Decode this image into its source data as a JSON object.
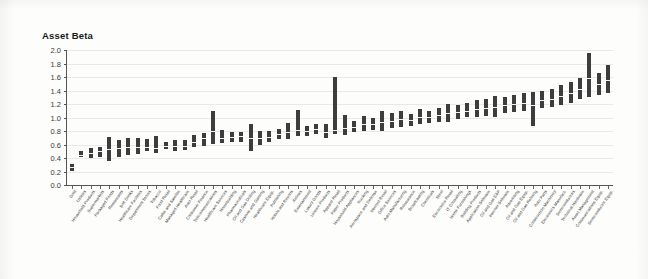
{
  "chart_data": {
    "type": "bar",
    "subtype": "floating-range-bar",
    "title": "Asset Beta",
    "xlabel": "",
    "ylabel": "Asset Beta",
    "ylim": [
      0.0,
      2.0
    ],
    "ytick_labels": [
      "0.0",
      "0.2",
      "0.4",
      "0.6",
      "0.8",
      "1.0",
      "1.2",
      "1.4",
      "1.6",
      "1.8",
      "2.0"
    ],
    "ytick_values": [
      0.0,
      0.2,
      0.4,
      0.6,
      0.8,
      1.0,
      1.2,
      1.4,
      1.6,
      1.8,
      2.0
    ],
    "grid": true,
    "legend": "none",
    "bar_color": "#3d3d3d",
    "categories": [
      "Gold",
      "Utilities",
      "Household Products",
      "Supermarkets",
      "Packaged Foods",
      "Restaurants",
      "Soft Drinks",
      "Healthcare Facilities",
      "Department Stores",
      "Tobacco",
      "Food Retail",
      "Cable and Satellite",
      "Managed Healthcare",
      "Auto Retail",
      "Consumer Finance",
      "Telecommunications",
      "Healthcare Services",
      "Homebuilding",
      "Pharmaceuticals",
      "Oil and Gas Drilling",
      "Casinos and Gaming",
      "Healthcare Equip.",
      "Publishing",
      "Hotels and Resorts",
      "Airlines",
      "Entertainment",
      "Luxury Goods",
      "Leisure Products",
      "Apparel Retail",
      "Paper Products",
      "Household Appliances",
      "Trucking",
      "Aerospace and Defense",
      "Internet Retail",
      "Office Services",
      "Auto Manufacturing",
      "Reinsurance",
      "Broadcasting",
      "Chemicals",
      "Steel",
      "Electronics Retail",
      "IT Consulting",
      "Home Furnishings",
      "Building Products",
      "Application Software",
      "Oil and Gas E&P",
      "Internet Software",
      "Advertising",
      "Oil and Gas Equip.",
      "Oil and Gas Refining",
      "Auto Parts",
      "Construction Machinery",
      "Electronics Manufact.",
      "Semiconductors",
      "Technical Hardware",
      "Asset Management",
      "Communications Equip.",
      "Semiconductor Equip."
    ],
    "ranges": [
      {
        "low": 0.21,
        "median": 0.27,
        "high": 0.31
      },
      {
        "low": 0.42,
        "median": 0.45,
        "high": 0.5
      },
      {
        "low": 0.4,
        "median": 0.47,
        "high": 0.55
      },
      {
        "low": 0.42,
        "median": 0.51,
        "high": 0.56
      },
      {
        "low": 0.36,
        "median": 0.53,
        "high": 0.71
      },
      {
        "low": 0.41,
        "median": 0.55,
        "high": 0.67
      },
      {
        "low": 0.44,
        "median": 0.56,
        "high": 0.69
      },
      {
        "low": 0.46,
        "median": 0.57,
        "high": 0.7
      },
      {
        "low": 0.5,
        "median": 0.57,
        "high": 0.68
      },
      {
        "low": 0.48,
        "median": 0.55,
        "high": 0.72
      },
      {
        "low": 0.54,
        "median": 0.58,
        "high": 0.63
      },
      {
        "low": 0.5,
        "median": 0.58,
        "high": 0.67
      },
      {
        "low": 0.52,
        "median": 0.58,
        "high": 0.66
      },
      {
        "low": 0.56,
        "median": 0.64,
        "high": 0.74
      },
      {
        "low": 0.58,
        "median": 0.69,
        "high": 0.77
      },
      {
        "low": 0.6,
        "median": 0.8,
        "high": 1.09
      },
      {
        "low": 0.62,
        "median": 0.69,
        "high": 0.81
      },
      {
        "low": 0.64,
        "median": 0.71,
        "high": 0.78
      },
      {
        "low": 0.64,
        "median": 0.73,
        "high": 0.79
      },
      {
        "low": 0.5,
        "median": 0.7,
        "high": 0.91
      },
      {
        "low": 0.6,
        "median": 0.7,
        "high": 0.8
      },
      {
        "low": 0.64,
        "median": 0.71,
        "high": 0.8
      },
      {
        "low": 0.68,
        "median": 0.76,
        "high": 0.83
      },
      {
        "low": 0.68,
        "median": 0.78,
        "high": 0.92
      },
      {
        "low": 0.72,
        "median": 0.82,
        "high": 1.11
      },
      {
        "low": 0.72,
        "median": 0.8,
        "high": 0.88
      },
      {
        "low": 0.76,
        "median": 0.83,
        "high": 0.9
      },
      {
        "low": 0.7,
        "median": 0.79,
        "high": 0.91
      },
      {
        "low": 0.76,
        "median": 0.82,
        "high": 1.6
      },
      {
        "low": 0.74,
        "median": 0.84,
        "high": 1.03
      },
      {
        "low": 0.78,
        "median": 0.86,
        "high": 0.95
      },
      {
        "low": 0.8,
        "median": 0.9,
        "high": 1.02
      },
      {
        "low": 0.82,
        "median": 0.9,
        "high": 1.0
      },
      {
        "low": 0.8,
        "median": 0.93,
        "high": 1.09
      },
      {
        "low": 0.84,
        "median": 0.95,
        "high": 1.06
      },
      {
        "low": 0.86,
        "median": 0.98,
        "high": 1.1
      },
      {
        "low": 0.88,
        "median": 0.96,
        "high": 1.05
      },
      {
        "low": 0.9,
        "median": 1.0,
        "high": 1.12
      },
      {
        "low": 0.92,
        "median": 1.01,
        "high": 1.1
      },
      {
        "low": 0.94,
        "median": 1.03,
        "high": 1.14
      },
      {
        "low": 0.94,
        "median": 1.06,
        "high": 1.2
      },
      {
        "low": 0.98,
        "median": 1.08,
        "high": 1.18
      },
      {
        "low": 1.0,
        "median": 1.1,
        "high": 1.22
      },
      {
        "low": 1.0,
        "median": 1.12,
        "high": 1.26
      },
      {
        "low": 1.02,
        "median": 1.14,
        "high": 1.28
      },
      {
        "low": 1.0,
        "median": 1.16,
        "high": 1.32
      },
      {
        "low": 1.06,
        "median": 1.18,
        "high": 1.3
      },
      {
        "low": 1.08,
        "median": 1.2,
        "high": 1.34
      },
      {
        "low": 1.1,
        "median": 1.22,
        "high": 1.36
      },
      {
        "low": 0.88,
        "median": 1.18,
        "high": 1.38
      },
      {
        "low": 1.14,
        "median": 1.26,
        "high": 1.4
      },
      {
        "low": 1.16,
        "median": 1.28,
        "high": 1.42
      },
      {
        "low": 1.18,
        "median": 1.32,
        "high": 1.48
      },
      {
        "low": 1.22,
        "median": 1.36,
        "high": 1.52
      },
      {
        "low": 1.28,
        "median": 1.42,
        "high": 1.58
      },
      {
        "low": 1.3,
        "median": 1.58,
        "high": 1.96
      },
      {
        "low": 1.34,
        "median": 1.5,
        "high": 1.66
      },
      {
        "low": 1.36,
        "median": 1.56,
        "high": 1.78
      }
    ]
  }
}
